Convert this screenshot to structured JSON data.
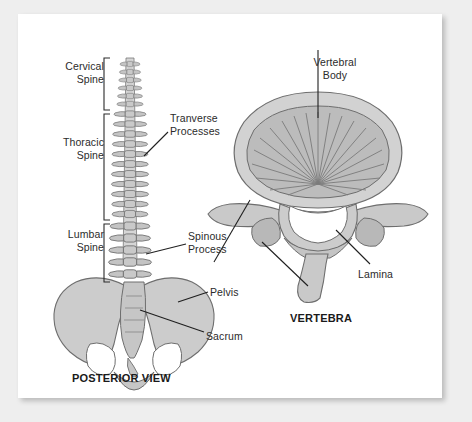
{
  "figure": {
    "background_color": "#eeeeee",
    "card_color": "#ffffff",
    "ink_color": "#2b2b2b",
    "bone_fill": "#cfcfcf",
    "bone_shade": "#b3b3b3",
    "bone_outline": "#6e6e6e",
    "labels": {
      "cervical_spine": "Cervical\nSpine",
      "thoracic_spine": "Thoracic\nSpine",
      "lumbar_spine": "Lumbar\nSpine",
      "transverse_processes": "Tranverse\nProcesses",
      "spinous_process": "Spinous\nProcess",
      "pelvis": "Pelvis",
      "sacrum": "Sacrum",
      "vertebral_body": "Vertebral\nBody",
      "lamina": "Lamina"
    },
    "captions": {
      "posterior_view": "POSTERIOR VIEW",
      "vertebra": "VERTEBRA"
    }
  }
}
